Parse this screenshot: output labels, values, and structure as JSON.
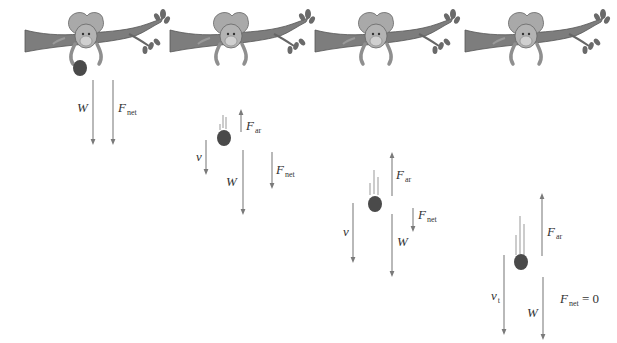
{
  "figure": {
    "colors": {
      "arrow": "#8a8a8a",
      "ball": "#4a4a4a",
      "branch": "#777777",
      "monkey": "#a8a8a8",
      "text": "#333333"
    },
    "panels": [
      {
        "id": 1,
        "labels": {
          "weight": "W",
          "fnet_main": "F",
          "fnet_sub": "net"
        }
      },
      {
        "id": 2,
        "labels": {
          "velocity": "v",
          "fair_main": "F",
          "fair_sub": "ar",
          "weight": "W",
          "fnet_main": "F",
          "fnet_sub": "net"
        }
      },
      {
        "id": 3,
        "labels": {
          "velocity": "v",
          "fair_main": "F",
          "fair_sub": "ar",
          "weight": "W",
          "fnet_main": "F",
          "fnet_sub": "net"
        }
      },
      {
        "id": 4,
        "labels": {
          "velocity_main": "v",
          "velocity_sub": "t",
          "fair_main": "F",
          "fair_sub": "ar",
          "weight": "W",
          "fnet_main": "F",
          "fnet_sub": "net",
          "fnet_eq": " = 0"
        }
      }
    ]
  }
}
